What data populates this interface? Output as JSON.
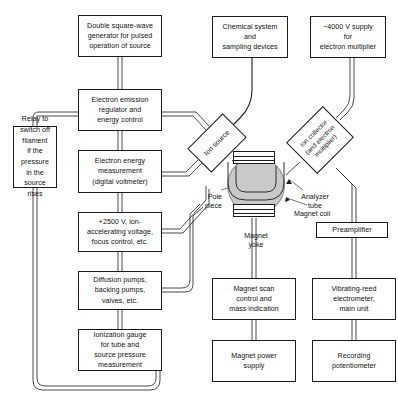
{
  "diagram": {
    "line_color": "#1a1a1a",
    "yoke_color": "#c9c9c9",
    "background": "#ffffff"
  },
  "boxes": {
    "double_square_wave": "Double square-wave\ngenerator for pulsed\noperation of source",
    "electron_emission": "Electron emission\nregulator and\nenergy control",
    "electron_energy": "Electron energy\nmeasurement\n(digital voltmeter)",
    "accelerating_voltage": "+2500 V, ion-\naccelerating voltage,\nfocus control, etc.",
    "diffusion_pumps": "Diffusion pumps,\nbacking pumps,\nvalves, etc.",
    "ionization_gauge": "Ionization gauge\nfor tube and\nsource pressure\nmeasurement",
    "relay": "Relay to\nswitch off\nfilament\nif the\npressure\nin the\nsource\nrises",
    "chemical_system": "Chemical system\nand\nsampling devices",
    "electron_multiplier_supply": "−4000 V supply\nfor\nelectron multiplier",
    "magnet_scan": "Magnet scan\ncontrol and\nmass indication",
    "magnet_power": "Magnet power\nsupply",
    "vibrating_reed": "Vibrating-reed\nelectrometer,\nmain unit",
    "recording_potentiometer": "Recording\npotentiometer",
    "preamplifier": "Preamplifier"
  },
  "components": {
    "ion_source": "Ion source",
    "ion_collector": "Ion collector\n(and electron\nmultiplier)"
  },
  "callouts": {
    "pole_piece": "Pole\npiece",
    "magnet_yoke": "Magnet\nyoke",
    "analyzer_tube": "Analyzer\ntube",
    "magnet_coil": "Magnet coil"
  }
}
